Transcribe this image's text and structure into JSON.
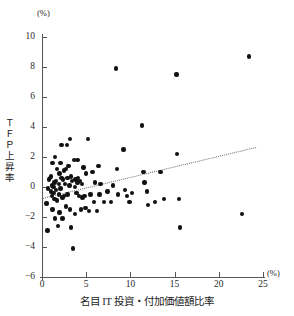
{
  "figure": {
    "y_axis_unit": "(%)",
    "x_axis_unit": "(%)",
    "y_axis_title_chars": [
      "Ｔ",
      "Ｆ",
      "Ｐ",
      "上",
      "昇",
      "率"
    ],
    "x_axis_title": "名目 IT 投資・付加価値額比率",
    "accent_color": "#111111",
    "axis_color": "#56565a",
    "trend_color": "#6d6d70"
  },
  "chart_data": {
    "type": "scatter",
    "title": "",
    "subtitle": "",
    "xlabel": "名目 IT 投資・付加価値額比率",
    "ylabel": "ＴＦＰ上昇率",
    "xunit": "(%)",
    "yunit": "(%)",
    "xlim": [
      0,
      25
    ],
    "ylim": [
      -6,
      10
    ],
    "xticks": [
      0,
      5,
      10,
      15,
      20,
      25
    ],
    "yticks": [
      10,
      8,
      6,
      4,
      2,
      0,
      -2,
      -4,
      -6
    ],
    "grid": false,
    "legend": null,
    "annotations": [],
    "series": [
      {
        "name": "企業別観測値",
        "marker": "filled-circle",
        "color": "#111111",
        "points": [
          [
            0.5,
            -1.1
          ],
          [
            0.6,
            -2.9
          ],
          [
            0.7,
            -0.1
          ],
          [
            0.8,
            0.5
          ],
          [
            0.9,
            0.6
          ],
          [
            1.0,
            0.7
          ],
          [
            1.0,
            -0.3
          ],
          [
            1.1,
            0.1
          ],
          [
            1.1,
            -0.6
          ],
          [
            1.2,
            1.6
          ],
          [
            1.2,
            -1.5
          ],
          [
            1.3,
            0.0
          ],
          [
            1.3,
            -0.4
          ],
          [
            1.4,
            0.3
          ],
          [
            1.4,
            -0.8
          ],
          [
            1.5,
            2.0
          ],
          [
            1.5,
            -2.1
          ],
          [
            1.6,
            0.4
          ],
          [
            1.6,
            -0.2
          ],
          [
            1.7,
            1.2
          ],
          [
            1.7,
            -0.9
          ],
          [
            1.8,
            -2.6
          ],
          [
            1.9,
            0.2
          ],
          [
            1.9,
            -0.5
          ],
          [
            2.0,
            0.9
          ],
          [
            2.0,
            -1.7
          ],
          [
            2.1,
            1.6
          ],
          [
            2.1,
            -0.1
          ],
          [
            2.2,
            2.8
          ],
          [
            2.2,
            0.6
          ],
          [
            2.3,
            -0.7
          ],
          [
            2.3,
            -2.1
          ],
          [
            2.4,
            0.5
          ],
          [
            2.5,
            1.1
          ],
          [
            2.5,
            -0.6
          ],
          [
            2.6,
            0.2
          ],
          [
            2.7,
            1.2
          ],
          [
            2.7,
            -1.3
          ],
          [
            2.8,
            2.8
          ],
          [
            2.9,
            0.6
          ],
          [
            2.9,
            -0.5
          ],
          [
            3.0,
            1.4
          ],
          [
            3.1,
            0.1
          ],
          [
            3.2,
            3.2
          ],
          [
            3.2,
            -1.5
          ],
          [
            3.3,
            0.7
          ],
          [
            3.3,
            -2.7
          ],
          [
            3.4,
            0.4
          ],
          [
            3.5,
            -4.1
          ],
          [
            3.6,
            1.8
          ],
          [
            3.7,
            0.0
          ],
          [
            3.7,
            -1.8
          ],
          [
            3.8,
            0.5
          ],
          [
            3.9,
            -0.4
          ],
          [
            4.0,
            1.8
          ],
          [
            4.0,
            0.3
          ],
          [
            4.1,
            0.6
          ],
          [
            4.2,
            -0.6
          ],
          [
            4.3,
            0.4
          ],
          [
            4.4,
            -1.5
          ],
          [
            4.5,
            0.2
          ],
          [
            4.6,
            -0.7
          ],
          [
            4.7,
            1.3
          ],
          [
            4.8,
            -0.6
          ],
          [
            4.9,
            -1.4
          ],
          [
            5.0,
            0.9
          ],
          [
            5.2,
            3.2
          ],
          [
            5.3,
            -1.6
          ],
          [
            5.5,
            -0.5
          ],
          [
            5.7,
            1.0
          ],
          [
            5.9,
            -1.0
          ],
          [
            6.0,
            0.3
          ],
          [
            6.2,
            -1.6
          ],
          [
            6.4,
            1.4
          ],
          [
            6.5,
            -0.5
          ],
          [
            6.6,
            0.2
          ],
          [
            7.0,
            -1.0
          ],
          [
            7.4,
            -0.3
          ],
          [
            7.8,
            -1.0
          ],
          [
            8.0,
            0.1
          ],
          [
            8.4,
            7.9
          ],
          [
            8.5,
            1.2
          ],
          [
            8.6,
            -0.5
          ],
          [
            9.2,
            2.5
          ],
          [
            9.4,
            -0.2
          ],
          [
            9.6,
            -0.6
          ],
          [
            9.9,
            -1.0
          ],
          [
            10.2,
            -0.4
          ],
          [
            11.3,
            4.1
          ],
          [
            11.5,
            1.0
          ],
          [
            11.6,
            0.3
          ],
          [
            11.9,
            -0.3
          ],
          [
            12.0,
            -1.2
          ],
          [
            12.8,
            -1.0
          ],
          [
            13.4,
            1.0
          ],
          [
            13.8,
            -0.8
          ],
          [
            15.2,
            7.5
          ],
          [
            15.3,
            2.2
          ],
          [
            15.5,
            -0.8
          ],
          [
            15.6,
            -2.7
          ],
          [
            22.6,
            -1.8
          ],
          [
            23.4,
            8.7
          ]
        ]
      }
    ],
    "trend": {
      "type": "dotted-linear-fit",
      "x_start": 0.0,
      "y_start": -0.7,
      "x_end": 24.2,
      "y_end": 2.7,
      "color": "#6d6d70"
    }
  }
}
